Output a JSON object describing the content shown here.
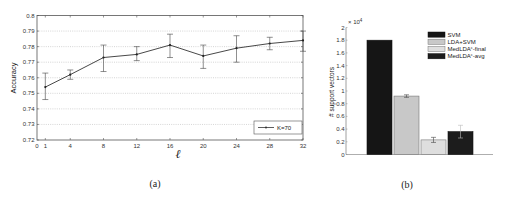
{
  "chart_data": [
    {
      "type": "line",
      "panel": "(a)",
      "title": "",
      "xlabel": "ℓ",
      "ylabel": "Accuracy",
      "x": [
        1,
        4,
        8,
        12,
        16,
        20,
        24,
        28,
        32
      ],
      "x_ticks": [
        "0",
        "1",
        "4",
        "8",
        "12",
        "16",
        "20",
        "24",
        "28",
        "32"
      ],
      "x_tick_values": [
        0,
        1,
        4,
        8,
        12,
        16,
        20,
        24,
        28,
        32
      ],
      "y_ticks": [
        "0.72",
        "0.73",
        "0.74",
        "0.75",
        "0.76",
        "0.77",
        "0.78",
        "0.79",
        "0.8"
      ],
      "y_tick_values": [
        0.72,
        0.73,
        0.74,
        0.75,
        0.76,
        0.77,
        0.78,
        0.79,
        0.8
      ],
      "xlim": [
        0,
        32
      ],
      "ylim": [
        0.72,
        0.8
      ],
      "grid": "horizontal dotted",
      "legend_position": "lower right",
      "series": [
        {
          "name": "K=70",
          "values": [
            0.754,
            0.762,
            0.773,
            0.775,
            0.781,
            0.774,
            0.779,
            0.782,
            0.784
          ],
          "error_low": [
            0.746,
            0.759,
            0.764,
            0.771,
            0.773,
            0.766,
            0.77,
            0.778,
            0.777
          ],
          "error_high": [
            0.763,
            0.765,
            0.781,
            0.78,
            0.788,
            0.781,
            0.787,
            0.786,
            0.79
          ]
        }
      ]
    },
    {
      "type": "bar",
      "panel": "(b)",
      "title": "",
      "xlabel": "",
      "ylabel": "# support vectors",
      "y_multiplier": "× 10⁴",
      "y_ticks": [
        "0",
        "0.2",
        "0.4",
        "0.6",
        "0.8",
        "1",
        "1.2",
        "1.4",
        "1.6",
        "1.8",
        "2"
      ],
      "y_tick_values": [
        0,
        0.2,
        0.4,
        0.6,
        0.8,
        1,
        1.2,
        1.4,
        1.6,
        1.8,
        2
      ],
      "ylim": [
        0,
        2
      ],
      "grid": "off",
      "legend_position": "upper right",
      "categories": [
        "SVM",
        "LDA+SVM",
        "MedLDA^c-final",
        "MedLDA^c-avg"
      ],
      "values": [
        1.8,
        0.92,
        0.23,
        0.36
      ],
      "errors": [
        0,
        0.02,
        0.04,
        0.1
      ],
      "colors": [
        "#151515",
        "#c8c8c8",
        "#dedede",
        "#1c1c1c"
      ]
    }
  ],
  "panel_a": {
    "ylabel": "Accuracy",
    "xlabel": "ℓ",
    "legend_label": "K=70",
    "caption": "(a)"
  },
  "panel_b": {
    "ylabel": "# support vectors",
    "multiplier_base": "× 10",
    "multiplier_exp": "4",
    "legend": [
      {
        "label": "SVM",
        "sup": "",
        "suffix": ""
      },
      {
        "label": "LDA+SVM",
        "sup": "",
        "suffix": ""
      },
      {
        "label": "MedLDA",
        "sup": "c",
        "suffix": "-final"
      },
      {
        "label": "MedLDA",
        "sup": "c",
        "suffix": "-avg"
      }
    ],
    "caption": "(b)"
  }
}
